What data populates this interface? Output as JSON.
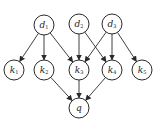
{
  "diagram": {
    "type": "directed-graph",
    "node_radius": 10,
    "stroke_color": "#2a2a2a",
    "nodes": [
      {
        "id": "d1",
        "base": "d",
        "sub": "1",
        "x": 44,
        "y": 25,
        "layer": "documents"
      },
      {
        "id": "d2",
        "base": "d",
        "sub": "2",
        "x": 79,
        "y": 24,
        "layer": "documents"
      },
      {
        "id": "d3",
        "base": "d",
        "sub": "3",
        "x": 112,
        "y": 24,
        "layer": "documents"
      },
      {
        "id": "k1",
        "base": "k",
        "sub": "1",
        "x": 14,
        "y": 70,
        "layer": "keywords"
      },
      {
        "id": "k2",
        "base": "k",
        "sub": "2",
        "x": 44,
        "y": 70,
        "layer": "keywords"
      },
      {
        "id": "k3",
        "base": "k",
        "sub": "3",
        "x": 79,
        "y": 70,
        "layer": "keywords"
      },
      {
        "id": "k4",
        "base": "k",
        "sub": "4",
        "x": 112,
        "y": 70,
        "layer": "keywords"
      },
      {
        "id": "k5",
        "base": "k",
        "sub": "5",
        "x": 142,
        "y": 70,
        "layer": "keywords"
      },
      {
        "id": "q",
        "base": "q",
        "sub": "",
        "x": 79,
        "y": 108,
        "layer": "query"
      }
    ],
    "edges": [
      {
        "from": "d1",
        "to": "k1"
      },
      {
        "from": "d1",
        "to": "k2"
      },
      {
        "from": "d1",
        "to": "k3"
      },
      {
        "from": "d2",
        "to": "k3"
      },
      {
        "from": "d2",
        "to": "k4"
      },
      {
        "from": "d3",
        "to": "k3"
      },
      {
        "from": "d3",
        "to": "k4"
      },
      {
        "from": "d3",
        "to": "k5"
      },
      {
        "from": "k2",
        "to": "q"
      },
      {
        "from": "k3",
        "to": "q"
      },
      {
        "from": "k4",
        "to": "q"
      }
    ]
  }
}
